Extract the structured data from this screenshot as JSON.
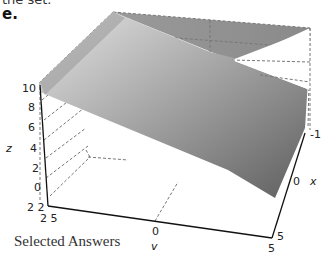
{
  "header": {
    "cut_text": "the set.",
    "part_label": "e."
  },
  "figure": {
    "type": "3d-surface-plot",
    "surface": "plane",
    "z_axis": {
      "label": "z",
      "ticks": [
        "10",
        "8",
        "6",
        "4",
        "2",
        "0"
      ]
    },
    "corner_ticks": {
      "z_bottom": "2 2",
      "v_left": "2 5"
    },
    "v_axis": {
      "label": "v",
      "ticks": [
        "0",
        "5"
      ]
    },
    "x_axis": {
      "label": "x",
      "ticks": [
        "-1",
        "0",
        "5"
      ]
    },
    "colors": {
      "surface_light": "#d9d9d9",
      "surface_dark": "#6e6e6e",
      "box_edge": "#888888"
    }
  },
  "footer": {
    "section_title": "Selected Answers"
  }
}
